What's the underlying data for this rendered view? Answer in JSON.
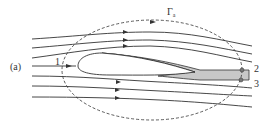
{
  "figure": {
    "panel_label": "(a)",
    "contour_label": "Γa",
    "contour_label_main": "Γ",
    "contour_label_sub": "a",
    "point_labels": [
      "1",
      "2",
      "3"
    ],
    "colors": {
      "line": "#333333",
      "wake_fill": "#c8c8c8",
      "background": "#ffffff"
    }
  }
}
